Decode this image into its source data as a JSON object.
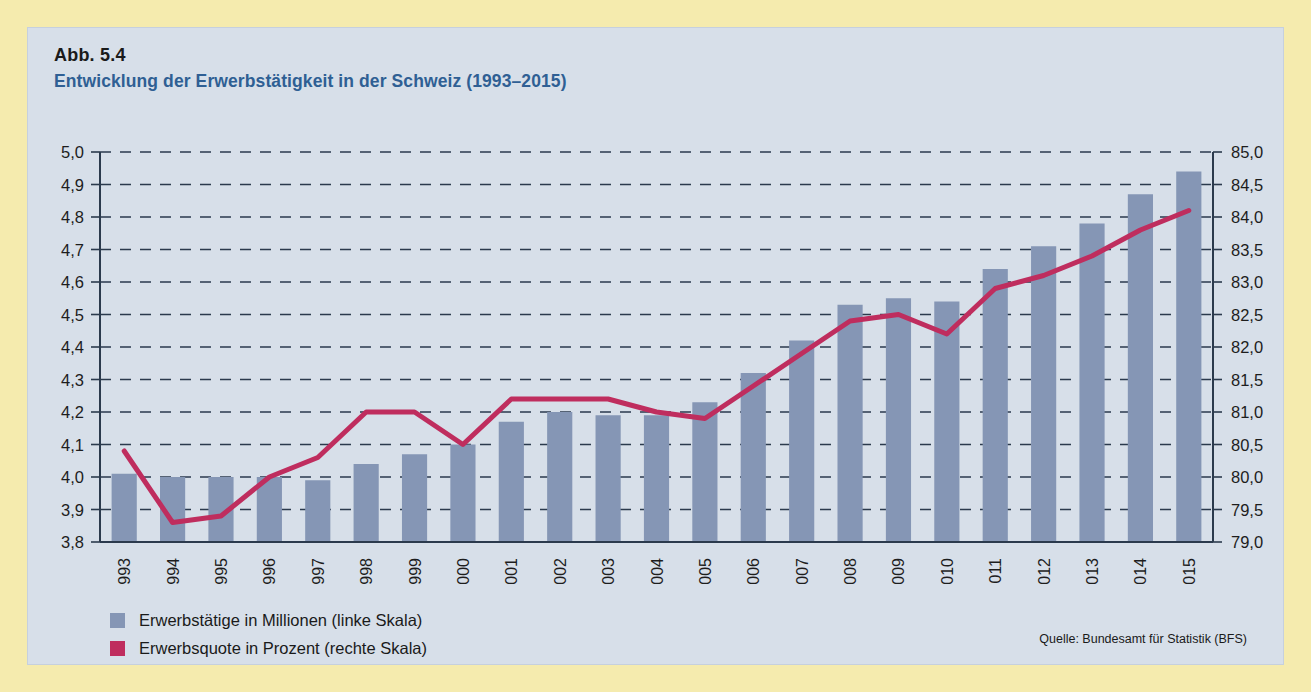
{
  "page": {
    "background_color": "#f5ebae",
    "panel_color": "#d7dfe9"
  },
  "caption": {
    "figure_number": "Abb. 5.4",
    "title": "Entwicklung der Erwerbstätigkeit in der Schweiz (1993–2015)"
  },
  "legend": {
    "items": [
      {
        "label": "Erwerbstätige in Millionen (linke Skala)",
        "color": "#8596b5",
        "type": "bar"
      },
      {
        "label": "Erwerbsquote in Prozent (rechte Skala)",
        "color": "#bf2d5e",
        "type": "line"
      }
    ]
  },
  "source": "Quelle: Bundesamt für Statistik (BFS)",
  "chart_data": {
    "type": "bar",
    "title": "Entwicklung der Erwerbstätigkeit in der Schweiz (1993–2015)",
    "xlabel": "",
    "ylabel": "",
    "grid": true,
    "legend_position": "bottom-left",
    "categories": [
      "1993",
      "1994",
      "1995",
      "1996",
      "1997",
      "1998",
      "1999",
      "2000",
      "2001",
      "2002",
      "2003",
      "2004",
      "2005",
      "2006",
      "2007",
      "2008",
      "2009",
      "2010",
      "2011",
      "2012",
      "2013",
      "2014",
      "2015"
    ],
    "x_tick_labels": [
      "1993",
      "1994",
      "1995",
      "1996",
      "1997",
      "1998",
      "1999",
      "2000",
      "2001",
      "2002",
      "2003",
      "2004",
      "2005",
      "2006",
      "2007",
      "2008",
      "2009",
      "2010",
      "2011",
      "2012",
      "2013",
      "2014",
      "2015"
    ],
    "x_tick_rotation": -90,
    "series": [
      {
        "name": "Erwerbstätige in Millionen (linke Skala)",
        "type": "bar",
        "axis": "left",
        "color": "#8596b5",
        "unit": "Millionen",
        "values": [
          4.01,
          4.0,
          4.0,
          4.0,
          3.99,
          4.04,
          4.07,
          4.1,
          4.17,
          4.2,
          4.19,
          4.19,
          4.23,
          4.32,
          4.42,
          4.53,
          4.55,
          4.54,
          4.64,
          4.71,
          4.78,
          4.87,
          4.94
        ]
      },
      {
        "name": "Erwerbsquote in Prozent (rechte Skala)",
        "type": "line",
        "axis": "right",
        "color": "#bf2d5e",
        "unit": "Prozent",
        "values": [
          80.4,
          79.3,
          79.4,
          80.0,
          80.3,
          81.0,
          81.0,
          80.5,
          81.2,
          81.2,
          81.2,
          81.0,
          80.9,
          81.4,
          81.9,
          82.4,
          82.5,
          82.2,
          82.9,
          83.1,
          83.4,
          83.8,
          84.1
        ]
      }
    ],
    "left_axis": {
      "ticks": [
        "5,0",
        "4,9",
        "4,8",
        "4,7",
        "4,6",
        "4,5",
        "4,4",
        "4,3",
        "4,2",
        "4,1",
        "4,0",
        "3,9",
        "3,8"
      ],
      "min": 3.8,
      "max": 5.0,
      "step": 0.1
    },
    "right_axis": {
      "ticks": [
        "85,0",
        "84,5",
        "84,0",
        "83,5",
        "83,0",
        "82,5",
        "82,0",
        "81,5",
        "81,0",
        "80,5",
        "80,0",
        "79,5",
        "79,0"
      ],
      "min": 79.0,
      "max": 85.0,
      "step": 0.5
    }
  }
}
